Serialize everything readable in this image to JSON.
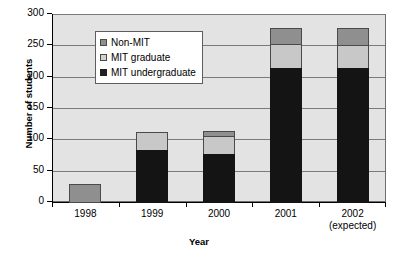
{
  "chart_data": {
    "type": "bar",
    "title": "",
    "subtitle": "",
    "xlabel": "Year",
    "ylabel": "Number of students",
    "categories": [
      "1998",
      "1999",
      "2000",
      "2001",
      "2002"
    ],
    "category_sublabels": [
      "",
      "",
      "",
      "",
      "(expected)"
    ],
    "ylim": [
      0,
      300
    ],
    "yticks": [
      0,
      50,
      100,
      150,
      200,
      250,
      300
    ],
    "ytick_labels": [
      "0",
      "50",
      "100",
      "150",
      "200",
      "250",
      "300"
    ],
    "grid": true,
    "stacked": true,
    "legend_position": "upper-left-inside",
    "series": [
      {
        "name": "MIT undergraduate",
        "color": "#141414",
        "values": [
          0,
          85,
          78,
          215,
          215
        ]
      },
      {
        "name": "MIT graduate",
        "color": "#c8c8c8",
        "values": [
          0,
          30,
          30,
          40,
          38
        ]
      },
      {
        "name": "Non-MIT",
        "color": "#8f8f8f",
        "values": [
          30,
          0,
          10,
          28,
          30
        ]
      }
    ],
    "totals": [
      30,
      115,
      118,
      283,
      283
    ],
    "legend_order": [
      "Non-MIT",
      "MIT graduate",
      "MIT undergraduate"
    ],
    "plot_background": "#e3e3e3",
    "gridline_color": "#7a7a7a"
  }
}
